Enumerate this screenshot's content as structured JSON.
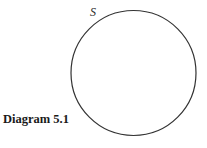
{
  "diagram": {
    "caption": "Diagram 5.1",
    "set_label": "S",
    "circle": {
      "cx": 133.5,
      "cy": 73,
      "r": 62.5,
      "stroke": "#333333",
      "stroke_width": 1.2
    }
  }
}
